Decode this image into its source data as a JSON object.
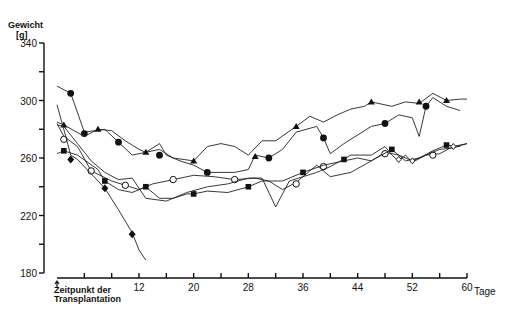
{
  "chart_data": {
    "type": "line",
    "title": "",
    "ylabel": "Gewicht [g]",
    "xlabel": "Tage",
    "xlim": [
      0,
      60
    ],
    "ylim": [
      180,
      340
    ],
    "x_ticks": [
      0,
      4,
      8,
      12,
      16,
      20,
      24,
      28,
      32,
      36,
      40,
      44,
      48,
      52,
      56,
      60
    ],
    "x_tick_labels": [
      "12",
      "20",
      "28",
      "36",
      "44",
      "52",
      "60"
    ],
    "x_tick_label_values": [
      12,
      20,
      28,
      36,
      44,
      52,
      60
    ],
    "y_ticks": [
      180,
      200,
      220,
      240,
      260,
      280,
      300,
      320,
      340
    ],
    "y_tick_labels": [
      "180",
      "220",
      "260",
      "300",
      "340"
    ],
    "y_tick_label_values": [
      180,
      220,
      260,
      300,
      340
    ],
    "annotation": {
      "x": 0,
      "text_line1": "Zeitpunkt der",
      "text_line2": "Transplantation",
      "marker": "arrow-up"
    },
    "grid": false,
    "legend": null,
    "series": [
      {
        "name": "filled-circle-upper",
        "marker": "circle-filled",
        "points": [
          [
            0,
            310
          ],
          [
            2,
            305
          ],
          [
            4,
            278
          ],
          [
            7,
            280
          ],
          [
            9,
            271
          ],
          [
            11,
            262
          ],
          [
            13,
            264
          ],
          [
            15,
            270
          ],
          [
            16,
            262
          ],
          [
            18,
            258
          ],
          [
            20,
            255
          ],
          [
            22,
            250
          ],
          [
            26,
            250
          ],
          [
            28,
            252
          ],
          [
            29,
            262
          ],
          [
            31,
            260
          ],
          [
            33,
            266
          ],
          [
            35,
            278
          ],
          [
            38,
            282
          ],
          [
            39,
            274
          ],
          [
            40,
            263
          ],
          [
            42,
            270
          ],
          [
            46,
            282
          ],
          [
            48,
            284
          ],
          [
            50,
            290
          ],
          [
            52,
            288
          ],
          [
            53,
            275
          ],
          [
            54,
            296
          ],
          [
            55,
            302
          ],
          [
            57,
            296
          ],
          [
            59,
            293
          ]
        ],
        "markers": [
          [
            2,
            305
          ],
          [
            4,
            277
          ],
          [
            9,
            271
          ],
          [
            15,
            262
          ],
          [
            22,
            250
          ],
          [
            31,
            260
          ],
          [
            39,
            274
          ],
          [
            48,
            284
          ],
          [
            54,
            296
          ]
        ]
      },
      {
        "name": "filled-triangle",
        "marker": "triangle-filled",
        "points": [
          [
            0,
            285
          ],
          [
            1,
            283
          ],
          [
            4,
            275
          ],
          [
            6,
            280
          ],
          [
            8,
            279
          ],
          [
            10,
            272
          ],
          [
            12,
            266
          ],
          [
            13,
            264
          ],
          [
            15,
            266
          ],
          [
            17,
            260
          ],
          [
            20,
            258
          ],
          [
            22,
            268
          ],
          [
            24,
            270
          ],
          [
            26,
            268
          ],
          [
            28,
            262
          ],
          [
            30,
            272
          ],
          [
            32,
            272
          ],
          [
            35,
            282
          ],
          [
            37,
            289
          ],
          [
            39,
            285
          ],
          [
            41,
            290
          ],
          [
            43,
            294
          ],
          [
            45,
            296
          ],
          [
            46,
            299
          ],
          [
            49,
            296
          ],
          [
            51,
            299
          ],
          [
            53,
            298
          ],
          [
            55,
            305
          ],
          [
            57,
            300
          ],
          [
            59,
            301
          ],
          [
            60,
            301
          ]
        ],
        "markers": [
          [
            1,
            283
          ],
          [
            6,
            280
          ],
          [
            13,
            264
          ],
          [
            20,
            258
          ],
          [
            29,
            261
          ],
          [
            35,
            282
          ],
          [
            46,
            299
          ],
          [
            53,
            299
          ],
          [
            57,
            300
          ]
        ]
      },
      {
        "name": "open-circle",
        "marker": "circle-open",
        "points": [
          [
            0,
            284
          ],
          [
            1,
            275
          ],
          [
            3,
            268
          ],
          [
            5,
            251
          ],
          [
            8,
            244
          ],
          [
            10,
            241
          ],
          [
            12,
            238
          ],
          [
            14,
            242
          ],
          [
            17,
            245
          ],
          [
            20,
            248
          ],
          [
            23,
            247
          ],
          [
            26,
            245
          ],
          [
            29,
            246
          ],
          [
            31,
            244
          ],
          [
            33,
            238
          ],
          [
            35,
            243
          ],
          [
            37,
            251
          ],
          [
            38,
            255
          ],
          [
            40,
            247
          ],
          [
            43,
            250
          ],
          [
            46,
            258
          ],
          [
            48,
            264
          ],
          [
            50,
            262
          ],
          [
            52,
            258
          ],
          [
            54,
            262
          ],
          [
            56,
            263
          ],
          [
            58,
            268
          ],
          [
            60,
            270
          ]
        ],
        "markers": [
          [
            1,
            273
          ],
          [
            5,
            251
          ],
          [
            10,
            241
          ],
          [
            17,
            245
          ],
          [
            26,
            245
          ],
          [
            35,
            242
          ],
          [
            39,
            254
          ],
          [
            48,
            263
          ],
          [
            55,
            262
          ]
        ]
      },
      {
        "name": "filled-square",
        "marker": "square-filled",
        "points": [
          [
            0,
            263
          ],
          [
            1,
            265
          ],
          [
            3,
            262
          ],
          [
            6,
            252
          ],
          [
            7,
            244
          ],
          [
            9,
            238
          ],
          [
            11,
            236
          ],
          [
            13,
            240
          ],
          [
            15,
            232
          ],
          [
            17,
            232
          ],
          [
            19,
            235
          ],
          [
            20,
            235
          ],
          [
            22,
            237
          ],
          [
            25,
            236
          ],
          [
            28,
            240
          ],
          [
            30,
            244
          ],
          [
            33,
            244
          ],
          [
            36,
            250
          ],
          [
            39,
            255
          ],
          [
            42,
            258
          ],
          [
            44,
            260
          ],
          [
            46,
            258
          ],
          [
            49,
            266
          ],
          [
            51,
            258
          ],
          [
            53,
            260
          ],
          [
            55,
            265
          ],
          [
            57,
            269
          ],
          [
            59,
            268
          ]
        ],
        "markers": [
          [
            1,
            265
          ],
          [
            7,
            244
          ],
          [
            13,
            240
          ],
          [
            20,
            235
          ],
          [
            28,
            240
          ],
          [
            36,
            250
          ],
          [
            42,
            259
          ],
          [
            49,
            266
          ],
          [
            57,
            269
          ]
        ]
      },
      {
        "name": "open-diamond-zigzag",
        "marker": "diamond-open",
        "points": [
          [
            0,
            283
          ],
          [
            1,
            282
          ],
          [
            3,
            270
          ],
          [
            5,
            258
          ],
          [
            7,
            250
          ],
          [
            9,
            245
          ],
          [
            11,
            246
          ],
          [
            13,
            232
          ],
          [
            16,
            230
          ],
          [
            19,
            236
          ],
          [
            22,
            240
          ],
          [
            25,
            242
          ],
          [
            28,
            246
          ],
          [
            30,
            246
          ],
          [
            32,
            226
          ],
          [
            34,
            244
          ],
          [
            36,
            247
          ],
          [
            38,
            250
          ],
          [
            40,
            254
          ],
          [
            43,
            262
          ],
          [
            46,
            262
          ],
          [
            48,
            268
          ],
          [
            49,
            262
          ],
          [
            50,
            258
          ],
          [
            51,
            262
          ],
          [
            52,
            257
          ],
          [
            54,
            262
          ],
          [
            56,
            266
          ],
          [
            58,
            267
          ],
          [
            60,
            270
          ]
        ],
        "markers": [
          [
            50,
            259
          ],
          [
            52,
            258
          ],
          [
            58,
            268
          ]
        ]
      },
      {
        "name": "filled-diamond-declining",
        "marker": "diamond-filled",
        "points": [
          [
            0,
            297
          ],
          [
            1,
            280
          ],
          [
            2,
            262
          ],
          [
            3,
            259
          ],
          [
            5,
            249
          ],
          [
            7,
            239
          ],
          [
            9,
            224
          ],
          [
            11,
            208
          ],
          [
            12,
            196
          ],
          [
            13,
            189
          ]
        ],
        "markers": [
          [
            2,
            259
          ],
          [
            7,
            239
          ],
          [
            11,
            207
          ]
        ]
      }
    ]
  },
  "axis": {
    "y_title_line1": "Gewicht",
    "y_title_line2": "[g]",
    "x_unit": "Tage"
  }
}
